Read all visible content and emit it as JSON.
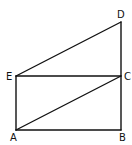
{
  "diagram": {
    "points": {
      "A": {
        "label": "A",
        "x": 16,
        "y": 130
      },
      "B": {
        "label": "B",
        "x": 121,
        "y": 130
      },
      "C": {
        "label": "C",
        "x": 121,
        "y": 76
      },
      "D": {
        "label": "D",
        "x": 121,
        "y": 22
      },
      "E": {
        "label": "E",
        "x": 16,
        "y": 76
      }
    },
    "segments": [
      "AB",
      "BC",
      "CD",
      "DE",
      "EA",
      "EC",
      "AC"
    ],
    "stroke_color": "#111111"
  }
}
